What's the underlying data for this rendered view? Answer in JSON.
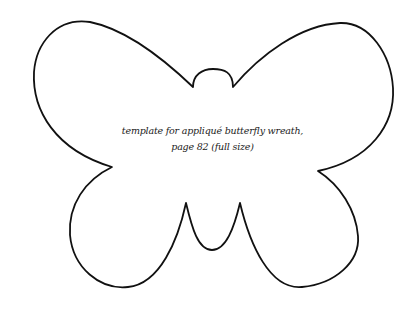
{
  "figure": {
    "type": "template-outline",
    "subject": "butterfly",
    "caption_lines": [
      "template for appliqué butterfly wreath,",
      "page 82 (full size)"
    ],
    "outline_color": "#111111",
    "background_color": "#ffffff"
  }
}
